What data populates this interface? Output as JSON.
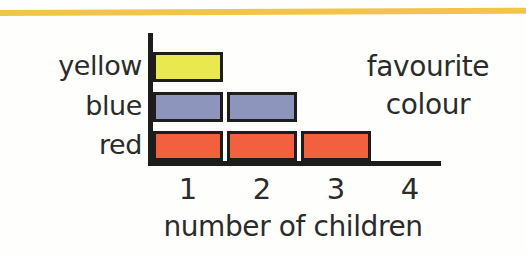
{
  "decoration": {
    "top_rule_color": "#f3c44a"
  },
  "chart_data": {
    "type": "bar",
    "orientation": "horizontal",
    "title": "favourite colour",
    "title_lines": [
      "favourite",
      "colour"
    ],
    "xlabel": "number of children",
    "ylabel": "",
    "categories": [
      "yellow",
      "blue",
      "red"
    ],
    "values": [
      1,
      2,
      3
    ],
    "xticks": [
      "1",
      "2",
      "3",
      "4"
    ],
    "xtick_values": [
      1,
      2,
      3,
      4
    ],
    "xlim": [
      0,
      4
    ],
    "grid": false,
    "legend": false,
    "unit": "one square = one child",
    "bar_colors": [
      "#e9e84e",
      "#8d95bd",
      "#f2603f"
    ],
    "outline_color": "#1d1d1b",
    "axis_color": "#1d1d1b",
    "background": "#fefefd",
    "series": [
      {
        "name": "yellow",
        "value": 1,
        "color": "#e9e84e"
      },
      {
        "name": "blue",
        "value": 2,
        "color": "#8d95bd"
      },
      {
        "name": "red",
        "value": 3,
        "color": "#f2603f"
      }
    ]
  }
}
